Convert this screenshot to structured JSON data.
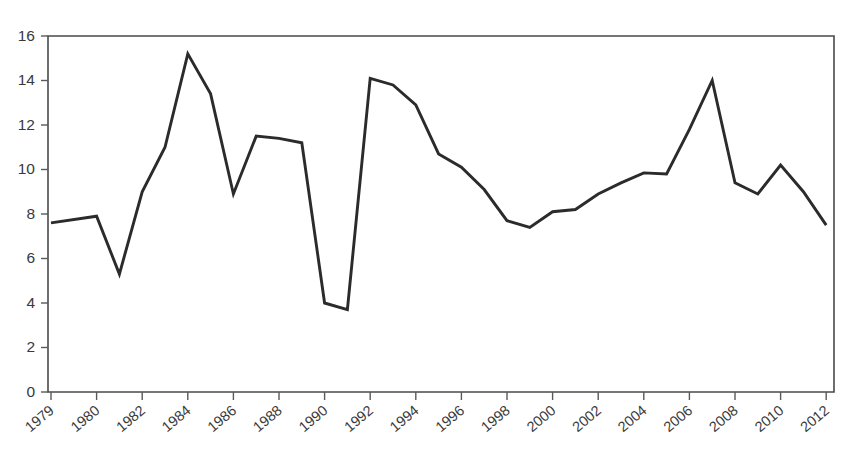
{
  "chart_data": {
    "type": "line",
    "title": "",
    "subtitle": "",
    "xlabel": "",
    "ylabel": "",
    "xlim": [
      1979,
      2012
    ],
    "ylim": [
      0,
      16
    ],
    "grid": false,
    "legend": null,
    "y_ticks": [
      0,
      2,
      4,
      6,
      8,
      10,
      12,
      14,
      16
    ],
    "y_tick_labels": [
      "0",
      "2",
      "4",
      "6",
      "8",
      "10",
      "12",
      "14",
      "16"
    ],
    "x_tick_labels": [
      "1979",
      "1980",
      "1982",
      "1984",
      "1986",
      "1988",
      "1990",
      "1992",
      "1994",
      "1996",
      "1998",
      "2000",
      "2002",
      "2004",
      "2006",
      "2008",
      "2010",
      "2012"
    ],
    "x": [
      1979,
      1980,
      1981,
      1982,
      1983,
      1984,
      1985,
      1986,
      1987,
      1988,
      1989,
      1990,
      1991,
      1992,
      1993,
      1994,
      1995,
      1996,
      1997,
      1998,
      1999,
      2000,
      2001,
      2002,
      2003,
      2004,
      2005,
      2006,
      2007,
      2008,
      2009,
      2010,
      2011,
      2012
    ],
    "values": [
      7.6,
      7.9,
      5.3,
      9.0,
      11.0,
      15.2,
      13.4,
      8.9,
      11.5,
      11.4,
      11.2,
      4.0,
      3.7,
      14.1,
      13.8,
      12.9,
      10.7,
      10.1,
      9.1,
      7.7,
      7.4,
      8.1,
      8.2,
      8.9,
      9.4,
      9.85,
      9.8,
      11.8,
      14.0,
      9.4,
      8.9,
      10.2,
      9.0,
      7.5
    ],
    "series": [
      {
        "name": "series-1",
        "color": "#2b2b2b",
        "values": [
          7.6,
          7.9,
          5.3,
          9.0,
          11.0,
          15.2,
          13.4,
          8.9,
          11.5,
          11.4,
          11.2,
          4.0,
          3.7,
          14.1,
          13.8,
          12.9,
          10.7,
          10.1,
          9.1,
          7.7,
          7.4,
          8.1,
          8.2,
          8.9,
          9.4,
          9.85,
          9.8,
          11.8,
          14.0,
          9.4,
          8.9,
          10.2,
          9.0,
          7.5
        ]
      }
    ],
    "annotations": []
  },
  "style": {
    "line_color": "#2b2b2b",
    "axis_color": "#4a4a4a",
    "tick_color": "#5a5a5a",
    "label_color": "#3a3a3a",
    "background": "#ffffff"
  },
  "geometry": {
    "plot_left": 48,
    "plot_right": 834,
    "plot_top": 36,
    "plot_bottom": 392,
    "x_tick_start": 51,
    "x_tick_step": 45.6,
    "x_label_rotation": -40
  }
}
